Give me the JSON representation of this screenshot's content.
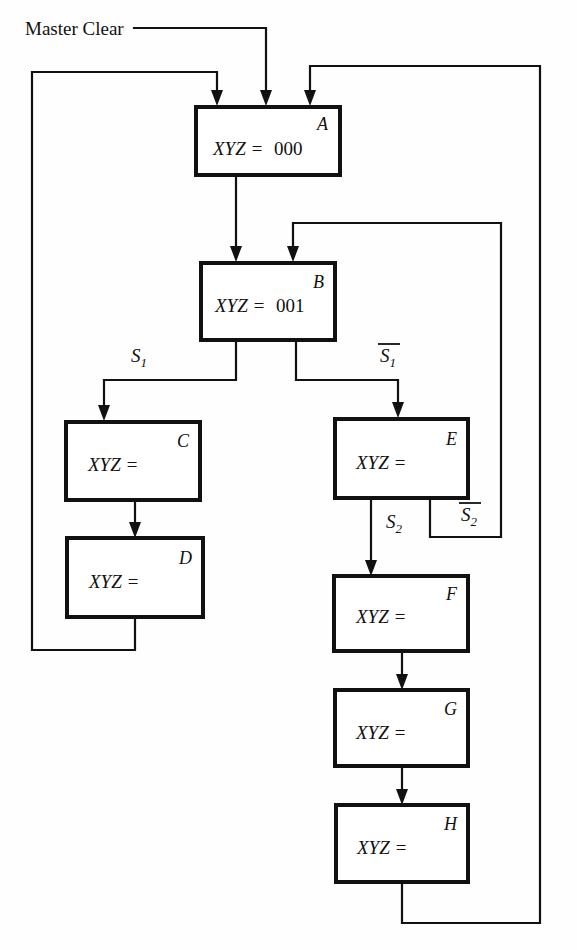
{
  "diagram": {
    "title_label": "Master Clear",
    "boxes": [
      {
        "id": "A",
        "letter": "A",
        "expr_lhs": "XYZ =",
        "expr_rhs": "000",
        "x": 196,
        "y": 107,
        "w": 144,
        "h": 68
      },
      {
        "id": "B",
        "letter": "B",
        "expr_lhs": "XYZ =",
        "expr_rhs": "001",
        "x": 201,
        "y": 263,
        "w": 134,
        "h": 77
      },
      {
        "id": "C",
        "letter": "C",
        "expr_lhs": "XYZ =",
        "expr_rhs": "",
        "x": 66,
        "y": 422,
        "w": 134,
        "h": 78
      },
      {
        "id": "D",
        "letter": "D",
        "expr_lhs": "XYZ =",
        "expr_rhs": "",
        "x": 67,
        "y": 538,
        "w": 136,
        "h": 79
      },
      {
        "id": "E",
        "letter": "E",
        "expr_lhs": "XYZ =",
        "expr_rhs": "",
        "x": 335,
        "y": 419,
        "w": 133,
        "h": 79
      },
      {
        "id": "F",
        "letter": "F",
        "expr_lhs": "XYZ =",
        "expr_rhs": "",
        "x": 334,
        "y": 576,
        "w": 134,
        "h": 75
      },
      {
        "id": "G",
        "letter": "G",
        "expr_lhs": "XYZ =",
        "expr_rhs": "",
        "x": 335,
        "y": 690,
        "w": 133,
        "h": 76
      },
      {
        "id": "H",
        "letter": "H",
        "expr_lhs": "XYZ =",
        "expr_rhs": "",
        "x": 336,
        "y": 805,
        "w": 132,
        "h": 77
      }
    ],
    "signals": [
      {
        "id": "S1",
        "base": "S",
        "sub": "1",
        "bar": false,
        "x": 139,
        "y": 362
      },
      {
        "id": "S1bar",
        "base": "S",
        "sub": "1",
        "bar": true,
        "x": 388,
        "y": 362
      },
      {
        "id": "S2",
        "base": "S",
        "sub": "2",
        "bar": false,
        "x": 394,
        "y": 528
      },
      {
        "id": "S2bar",
        "base": "S",
        "sub": "2",
        "bar": true,
        "x": 469,
        "y": 521
      }
    ],
    "colors": {
      "ink": "#111111",
      "paper": "#ffffff"
    }
  }
}
